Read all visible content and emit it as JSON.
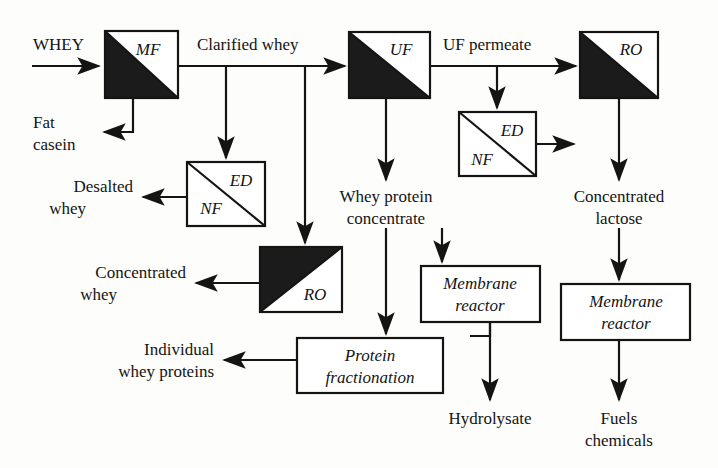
{
  "diagram": {
    "type": "process-flow",
    "background_color": "#fdfdfb",
    "line_color": "#141414",
    "fill_dark": "#1b1b1b",
    "units": [
      {
        "id": "mf",
        "tag": "MF",
        "shading": "lower-left-dark",
        "tag_corner": "upper-right"
      },
      {
        "id": "uf",
        "tag": "UF",
        "shading": "lower-left-dark",
        "tag_corner": "upper-right"
      },
      {
        "id": "ro_top",
        "tag": "RO",
        "shading": "lower-left-dark",
        "tag_corner": "upper-right"
      },
      {
        "id": "ed_nf_left",
        "tag_upper": "ED",
        "tag_lower": "NF",
        "shading": "none",
        "diagonal": "tl-br"
      },
      {
        "id": "ed_nf_right",
        "tag_upper": "ED",
        "tag_lower": "NF",
        "shading": "none",
        "diagonal": "tl-br"
      },
      {
        "id": "ro_bottom",
        "tag": "RO",
        "shading": "upper-left-dark",
        "tag_corner": "lower-right"
      },
      {
        "id": "membrane_reactor_1",
        "line1": "Membrane",
        "line2": "reactor"
      },
      {
        "id": "membrane_reactor_2",
        "line1": "Membrane",
        "line2": "reactor"
      },
      {
        "id": "protein_fractionation",
        "line1": "Protein",
        "line2": "fractionation"
      }
    ],
    "stream_labels": {
      "feed": "WHEY",
      "mf_retentate_line1": "Fat",
      "mf_retentate_line2": "casein",
      "mf_permeate": "Clarified whey",
      "uf_permeate": "UF permeate",
      "desalted_line1": "Desalted",
      "desalted_line2": "whey",
      "concentrated_whey_line1": "Concentrated",
      "concentrated_whey_line2": "whey",
      "wpc_line1": "Whey protein",
      "wpc_line2": "concentrate",
      "concentrated_lactose_line1": "Concentrated",
      "concentrated_lactose_line2": "lactose",
      "individual_line1": "Individual",
      "individual_line2": "whey proteins",
      "hydrolysate": "Hydrolysate",
      "fuels_line1": "Fuels",
      "fuels_line2": "chemicals"
    },
    "unit_labels": {
      "mf": "MF",
      "uf": "UF",
      "ro_top": "RO",
      "ro_bottom": "RO",
      "ed_left": "ED",
      "nf_left": "NF",
      "ed_right": "ED",
      "nf_right": "NF",
      "membrane_1_line1": "Membrane",
      "membrane_1_line2": "reactor",
      "membrane_2_line1": "Membrane",
      "membrane_2_line2": "reactor",
      "protein_line1": "Protein",
      "protein_line2": "fractionation"
    }
  }
}
